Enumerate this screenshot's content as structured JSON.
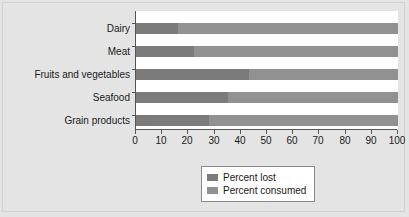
{
  "chart_data": {
    "type": "bar",
    "orientation": "horizontal",
    "stacked": true,
    "title": "",
    "subtitle": "",
    "xlabel": "",
    "ylabel": "",
    "xlim": [
      0,
      100
    ],
    "xticks": [
      0,
      10,
      20,
      30,
      40,
      50,
      60,
      70,
      80,
      90,
      100
    ],
    "xtick_labels": [
      "0",
      "10",
      "20",
      "30",
      "40",
      "50",
      "60",
      "70",
      "80",
      "90",
      "100"
    ],
    "grid": false,
    "legend_position": "bottom",
    "categories": [
      "Dairy",
      "Meat",
      "Fruits and vegetables",
      "Seafood",
      "Grain products"
    ],
    "series": [
      {
        "name": "Percent lost",
        "color": "#7b7b7b",
        "values": [
          16,
          22,
          43,
          35,
          28
        ]
      },
      {
        "name": "Percent consumed",
        "color": "#919191",
        "values": [
          84,
          78,
          57,
          65,
          72
        ]
      }
    ],
    "annotations": []
  },
  "legend": {
    "items": [
      {
        "label": "Percent lost",
        "color": "#7b7b7b"
      },
      {
        "label": "Percent consumed",
        "color": "#919191"
      }
    ]
  },
  "colors": {
    "background": "#e4e4e4",
    "plot_background": "#ffffff",
    "axis": "#555555",
    "text": "#1a1a1a",
    "series_lost": "#7b7b7b",
    "series_consumed": "#919191"
  }
}
